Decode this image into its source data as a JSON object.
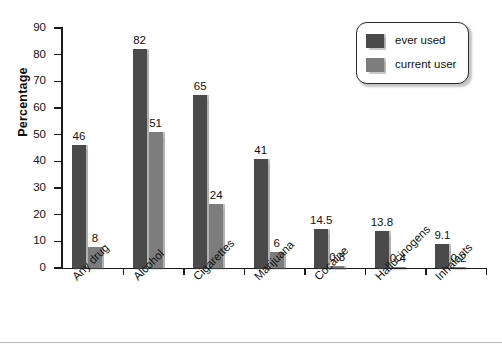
{
  "chart_data": {
    "type": "bar",
    "title": "",
    "xlabel": "",
    "ylabel": "Percentage",
    "ylim": [
      0,
      90
    ],
    "ytick_step": 10,
    "yticks": [
      "0",
      "10",
      "20",
      "30",
      "40",
      "50",
      "60",
      "70",
      "80",
      "90"
    ],
    "grid": false,
    "legend_position": "top-right",
    "categories": [
      "Any drug",
      "Alcohol",
      "Cigarettes",
      "Marijuana",
      "Cocaine",
      "Hallucinogens",
      "Inhalants"
    ],
    "series": [
      {
        "name": "ever used",
        "color": "#4a4a4a",
        "values": [
          46,
          82,
          65,
          41,
          14.5,
          13.8,
          9.1
        ],
        "labels": [
          "46",
          "82",
          "65",
          "41",
          "14.5",
          "13.8",
          "9.1"
        ]
      },
      {
        "name": "current user",
        "color": "#7d7d7d",
        "values": [
          8,
          51,
          24,
          6,
          0.8,
          0.4,
          0.2
        ],
        "labels": [
          "8",
          "51",
          "24",
          "6",
          "0.8",
          "0.4",
          "0.2"
        ]
      }
    ]
  },
  "legend": {
    "items": [
      {
        "label": "ever used",
        "swatch": "#4a4a4a"
      },
      {
        "label": "current user",
        "swatch": "#7d7d7d"
      }
    ]
  },
  "axes": {
    "y_title": "Percentage"
  }
}
